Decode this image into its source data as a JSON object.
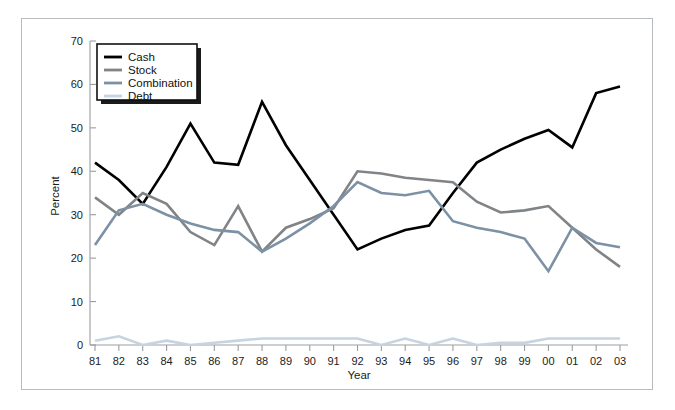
{
  "chart_data": {
    "type": "line",
    "title": "",
    "xlabel": "Year",
    "ylabel": "Percent",
    "x": [
      "81",
      "82",
      "83",
      "84",
      "85",
      "86",
      "87",
      "88",
      "89",
      "90",
      "91",
      "92",
      "93",
      "94",
      "95",
      "96",
      "97",
      "98",
      "99",
      "00",
      "01",
      "02",
      "03"
    ],
    "categories": [
      "81",
      "82",
      "83",
      "84",
      "85",
      "86",
      "87",
      "88",
      "89",
      "90",
      "91",
      "92",
      "93",
      "94",
      "95",
      "96",
      "97",
      "98",
      "99",
      "00",
      "01",
      "02",
      "03"
    ],
    "ylim": [
      0,
      70
    ],
    "yticks": [
      0,
      10,
      20,
      30,
      40,
      50,
      60,
      70
    ],
    "grid": false,
    "legend_position": "top-left",
    "series": [
      {
        "name": "Cash",
        "color": "#000000",
        "width": 2.6,
        "values": [
          42,
          38,
          32.5,
          41,
          51,
          42,
          41.5,
          56,
          46,
          38,
          30,
          22,
          24.5,
          26.5,
          27.5,
          35,
          42,
          45,
          47.5,
          49.5,
          45.5,
          58,
          59.5
        ]
      },
      {
        "name": "Stock",
        "color": "#808487",
        "width": 2.6,
        "values": [
          34,
          30,
          35,
          32.5,
          26,
          23,
          32,
          21.5,
          27,
          29,
          31.5,
          40,
          39.5,
          38.5,
          38,
          37.5,
          33,
          30.5,
          31,
          32,
          27,
          22,
          18
        ]
      },
      {
        "name": "Combination",
        "color": "#7d91a5",
        "width": 2.6,
        "values": [
          23,
          31,
          32.5,
          30,
          28,
          26.5,
          26,
          21.5,
          24.5,
          28,
          32,
          37.5,
          35,
          34.5,
          35.5,
          28.5,
          27,
          26,
          24.5,
          17,
          27,
          23.5,
          22.5
        ]
      },
      {
        "name": "Debt",
        "color": "#c6d3e1",
        "width": 2.6,
        "values": [
          1,
          2,
          0,
          1,
          0,
          0.5,
          1,
          1.5,
          1.5,
          1.5,
          1.5,
          1.5,
          0,
          1.5,
          0,
          1.5,
          0,
          0.5,
          0.5,
          1.5,
          1.5,
          1.5,
          1.5
        ]
      }
    ]
  },
  "legend": {
    "items": [
      {
        "label": "Cash"
      },
      {
        "label": "Stock"
      },
      {
        "label": "Combination"
      },
      {
        "label": "Debt"
      }
    ]
  },
  "axes": {
    "y_title": "Percent",
    "x_title": "Year",
    "y_tick_labels": [
      "70",
      "60",
      "50",
      "40",
      "30",
      "20",
      "10",
      "0"
    ],
    "x_tick_labels": [
      "81",
      "82",
      "83",
      "84",
      "85",
      "86",
      "87",
      "88",
      "89",
      "90",
      "91",
      "92",
      "93",
      "94",
      "95",
      "96",
      "97",
      "98",
      "99",
      "00",
      "01",
      "02",
      "03"
    ]
  },
  "colors": {
    "cash": "#000000",
    "stock": "#808487",
    "combination": "#7d91a5",
    "debt": "#c6d3e1",
    "axis": "#9a9da0",
    "frame": "#b9bcbe",
    "background": "#ffffff"
  }
}
